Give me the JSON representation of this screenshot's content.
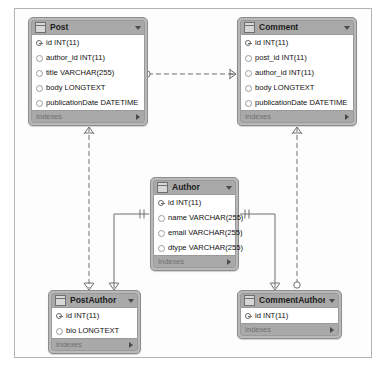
{
  "diagram": {
    "notation": "crows-foot",
    "colors": {
      "header": "#a9a9a9",
      "node_body": "#b9b9b9",
      "row_bg": "#ffffff",
      "border": "#8d8d8d",
      "line": "#6e6e6e",
      "canvas_border": "#b4b4b4"
    },
    "footer_label": "Indexes"
  },
  "tables": [
    {
      "name": "Post",
      "x": 28,
      "y": 17,
      "width": 120,
      "columns": [
        {
          "mark": "pk",
          "text": "id INT(11)"
        },
        {
          "mark": "plain",
          "text": "author_id INT(11)"
        },
        {
          "mark": "plain",
          "text": "title VARCHAR(255)"
        },
        {
          "mark": "plain",
          "text": "body LONGTEXT"
        },
        {
          "mark": "plain",
          "text": "publicationDate DATETIME"
        }
      ]
    },
    {
      "name": "Comment",
      "x": 237,
      "y": 17,
      "width": 120,
      "columns": [
        {
          "mark": "pk",
          "text": "id INT(11)"
        },
        {
          "mark": "plain",
          "text": "post_id INT(11)"
        },
        {
          "mark": "plain",
          "text": "author_id INT(11)"
        },
        {
          "mark": "plain",
          "text": "body LONGTEXT"
        },
        {
          "mark": "plain",
          "text": "publicationDate DATETIME"
        }
      ]
    },
    {
      "name": "Author",
      "x": 150,
      "y": 177,
      "width": 89,
      "columns": [
        {
          "mark": "pk",
          "text": "id INT(11)"
        },
        {
          "mark": "plain",
          "text": "name VARCHAR(255)"
        },
        {
          "mark": "plain",
          "text": "email VARCHAR(255)"
        },
        {
          "mark": "plain",
          "text": "dtype VARCHAR(255)"
        }
      ]
    },
    {
      "name": "PostAuthor",
      "x": 48,
      "y": 290,
      "width": 93,
      "columns": [
        {
          "mark": "pk",
          "text": "id INT(11)"
        },
        {
          "mark": "plain",
          "text": "bio LONGTEXT"
        }
      ]
    },
    {
      "name": "CommentAuthor",
      "x": 237,
      "y": 290,
      "width": 105,
      "columns": [
        {
          "mark": "pk",
          "text": "id INT(11)"
        }
      ]
    }
  ],
  "relationships": [
    {
      "from": "Post",
      "to": "Comment",
      "style": "dashed",
      "from_end": "zero-or-one",
      "to_end": "many"
    },
    {
      "from": "Post",
      "to": "PostAuthor",
      "style": "dashed",
      "from_end": "many",
      "to_end": "many"
    },
    {
      "from": "Comment",
      "to": "CommentAuthor",
      "style": "dashed",
      "from_end": "many",
      "to_end": "zero-or-one"
    },
    {
      "from": "Author",
      "to": "PostAuthor",
      "style": "solid",
      "from_end": "one-one",
      "to_end": "many"
    },
    {
      "from": "Author",
      "to": "CommentAuthor",
      "style": "solid",
      "from_end": "one-one",
      "to_end": "many"
    }
  ]
}
